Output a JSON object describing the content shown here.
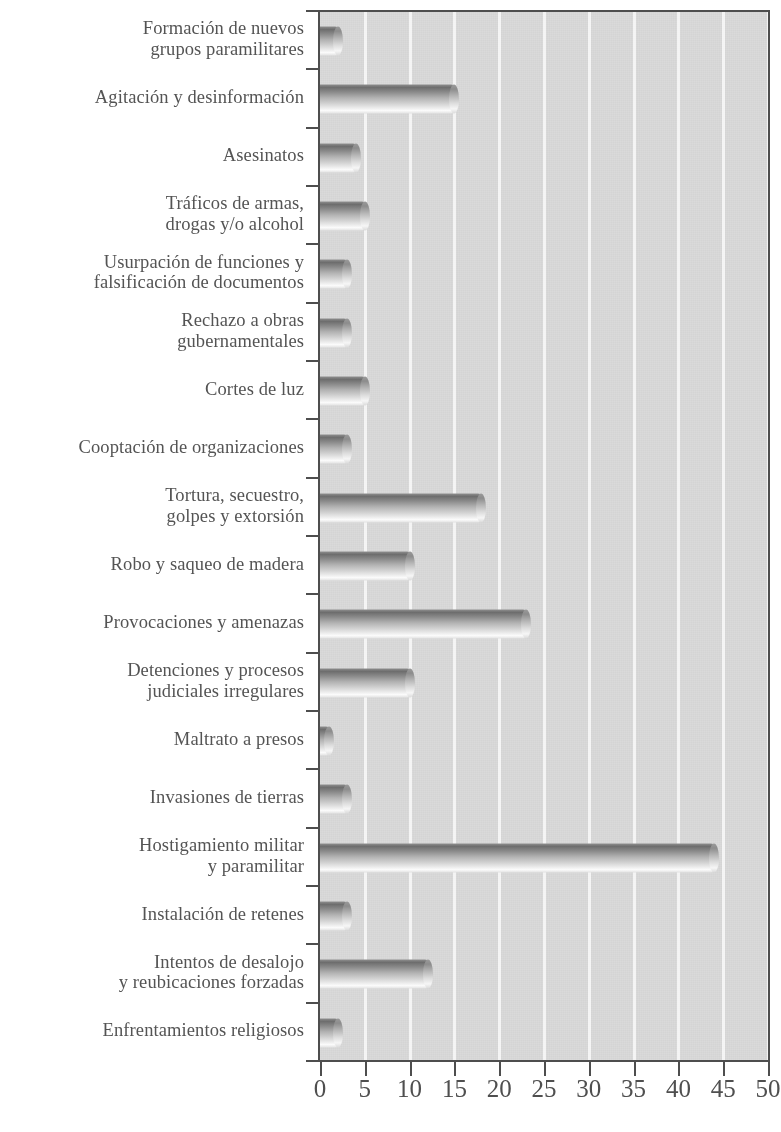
{
  "chart_data": {
    "type": "bar",
    "orientation": "horizontal",
    "title": "",
    "subtitle": "",
    "xlabel": "",
    "ylabel": "",
    "xlim": [
      0,
      50
    ],
    "xticks": [
      0,
      5,
      10,
      15,
      20,
      25,
      30,
      35,
      40,
      45,
      50
    ],
    "xtick_labels": [
      "0",
      "5",
      "10",
      "15",
      "20",
      "25",
      "30",
      "35",
      "40",
      "45",
      "50"
    ],
    "grid": "vertical",
    "legend": "none",
    "categories": [
      "Formación de nuevos\ngrupos paramilitares",
      "Agitación y desinformación",
      "Asesinatos",
      "Tráficos de armas,\ndrogas y/o alcohol",
      "Usurpación de funciones y\nfalsificación de documentos",
      "Rechazo a obras\ngubernamentales",
      "Cortes de luz",
      "Cooptación de organizaciones",
      "Tortura, secuestro,\ngolpes y extorsión",
      "Robo y saqueo de madera",
      "Provocaciones y amenazas",
      "Detenciones y procesos\njudiciales irregulares",
      "Maltrato a presos",
      "Invasiones de tierras",
      "Hostigamiento militar\ny paramilitar",
      "Instalación de retenes",
      "Intentos de desalojo\ny reubicaciones forzadas",
      "Enfrentamientos religiosos"
    ],
    "values": [
      2,
      15,
      4,
      5,
      3,
      3,
      5,
      3,
      18,
      10,
      23,
      10,
      1,
      3,
      44,
      3,
      12,
      2
    ],
    "colors": {
      "plot_background": "#d7d7d7",
      "gridline": "#f4f4f4",
      "axis": "#4e4e4e",
      "bar_light": "#fbfbfb",
      "bar_dark": "#6d6d6d",
      "label_text": "#545454",
      "page_background": "#ffffff"
    }
  }
}
